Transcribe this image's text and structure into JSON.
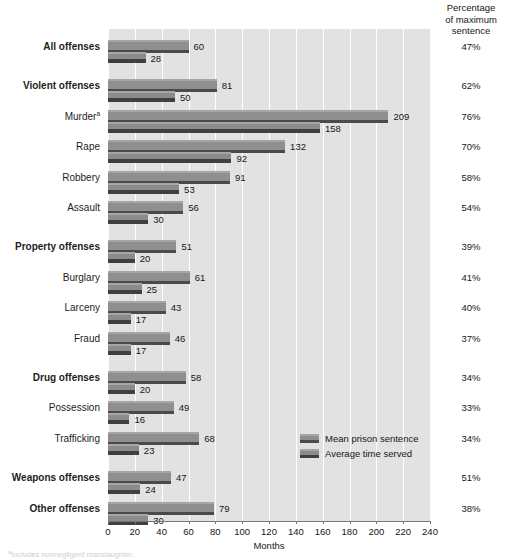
{
  "right_column_header": [
    "Percentage",
    "of maximum",
    "sentence"
  ],
  "axis": {
    "xlabel": "Months",
    "ticks": [
      0,
      20,
      40,
      60,
      80,
      100,
      120,
      140,
      160,
      180,
      200,
      220,
      240
    ],
    "xmin": 0,
    "xmax": 240
  },
  "legend": {
    "position": "inside-right",
    "items": [
      {
        "label": "Mean prison sentence",
        "key": "mean",
        "color": "#8f8f8f"
      },
      {
        "label": "Average time served",
        "key": "served",
        "color": "#8b8b8b"
      }
    ]
  },
  "footnote": "aIncludes nonnegligent manslaughter.",
  "footnote_marker": "a",
  "chart_data": {
    "type": "bar",
    "orientation": "horizontal",
    "title": "",
    "subtitle": "",
    "xlabel": "Months",
    "ylabel": "",
    "xlim": [
      0,
      240
    ],
    "grid": "vertical-white-gridlines",
    "categories": [
      "All offenses",
      "Violent offenses",
      "Murder",
      "Rape",
      "Robbery",
      "Assault",
      "Property offenses",
      "Burglary",
      "Larceny",
      "Fraud",
      "Drug offenses",
      "Possession",
      "Trafficking",
      "Weapons offenses",
      "Other offenses"
    ],
    "series": [
      {
        "name": "Mean prison sentence",
        "values": [
          60,
          81,
          209,
          132,
          91,
          56,
          51,
          61,
          43,
          46,
          58,
          49,
          68,
          47,
          79
        ]
      },
      {
        "name": "Average time served",
        "values": [
          28,
          50,
          158,
          92,
          53,
          30,
          20,
          25,
          17,
          17,
          20,
          16,
          23,
          24,
          30
        ]
      }
    ],
    "percent_of_maximum_sentence": [
      "47%",
      "62%",
      "76%",
      "70%",
      "58%",
      "54%",
      "39%",
      "41%",
      "40%",
      "37%",
      "34%",
      "33%",
      "34%",
      "51%",
      "38%"
    ]
  },
  "rows": [
    {
      "label": "All offenses",
      "bold": true,
      "superscript": "",
      "mean": 60,
      "served": 28,
      "pct": "47%",
      "group_gap": false
    },
    {
      "label": "Violent offenses",
      "bold": true,
      "superscript": "",
      "mean": 81,
      "served": 50,
      "pct": "62%",
      "group_gap": true
    },
    {
      "label": "Murder",
      "bold": false,
      "superscript": "a",
      "mean": 209,
      "served": 158,
      "pct": "76%",
      "group_gap": false
    },
    {
      "label": "Rape",
      "bold": false,
      "superscript": "",
      "mean": 132,
      "served": 92,
      "pct": "70%",
      "group_gap": false
    },
    {
      "label": "Robbery",
      "bold": false,
      "superscript": "",
      "mean": 91,
      "served": 53,
      "pct": "58%",
      "group_gap": false
    },
    {
      "label": "Assault",
      "bold": false,
      "superscript": "",
      "mean": 56,
      "served": 30,
      "pct": "54%",
      "group_gap": false
    },
    {
      "label": "Property offenses",
      "bold": true,
      "superscript": "",
      "mean": 51,
      "served": 20,
      "pct": "39%",
      "group_gap": true
    },
    {
      "label": "Burglary",
      "bold": false,
      "superscript": "",
      "mean": 61,
      "served": 25,
      "pct": "41%",
      "group_gap": false
    },
    {
      "label": "Larceny",
      "bold": false,
      "superscript": "",
      "mean": 43,
      "served": 17,
      "pct": "40%",
      "group_gap": false
    },
    {
      "label": "Fraud",
      "bold": false,
      "superscript": "",
      "mean": 46,
      "served": 17,
      "pct": "37%",
      "group_gap": false
    },
    {
      "label": "Drug offenses",
      "bold": true,
      "superscript": "",
      "mean": 58,
      "served": 20,
      "pct": "34%",
      "group_gap": true
    },
    {
      "label": "Possession",
      "bold": false,
      "superscript": "",
      "mean": 49,
      "served": 16,
      "pct": "33%",
      "group_gap": false
    },
    {
      "label": "Trafficking",
      "bold": false,
      "superscript": "",
      "mean": 68,
      "served": 23,
      "pct": "34%",
      "group_gap": false
    },
    {
      "label": "Weapons offenses",
      "bold": true,
      "superscript": "",
      "mean": 47,
      "served": 24,
      "pct": "51%",
      "group_gap": true
    },
    {
      "label": "Other offenses",
      "bold": true,
      "superscript": "",
      "mean": 79,
      "served": 30,
      "pct": "38%",
      "group_gap": false
    }
  ]
}
